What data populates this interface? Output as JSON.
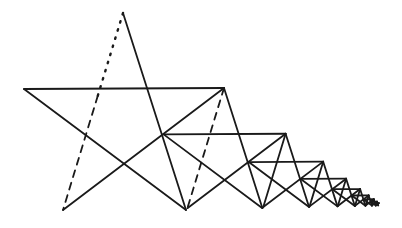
{
  "diagram": {
    "stroke_color": "#1a1a1a",
    "background": "#ffffff",
    "first_star": {
      "apex": [
        123,
        13
      ],
      "left": [
        24,
        89
      ],
      "right": [
        224,
        88
      ],
      "bottom_left": [
        63,
        210
      ],
      "bottom_right": [
        186,
        210
      ]
    },
    "scale_ratio": 0.61,
    "star_count": 9,
    "first_star_special_edges": {
      "dotted": "upper part of apex-to-bottom-left edge",
      "dashed": "lower part of apex-to-bottom-left edge"
    }
  }
}
